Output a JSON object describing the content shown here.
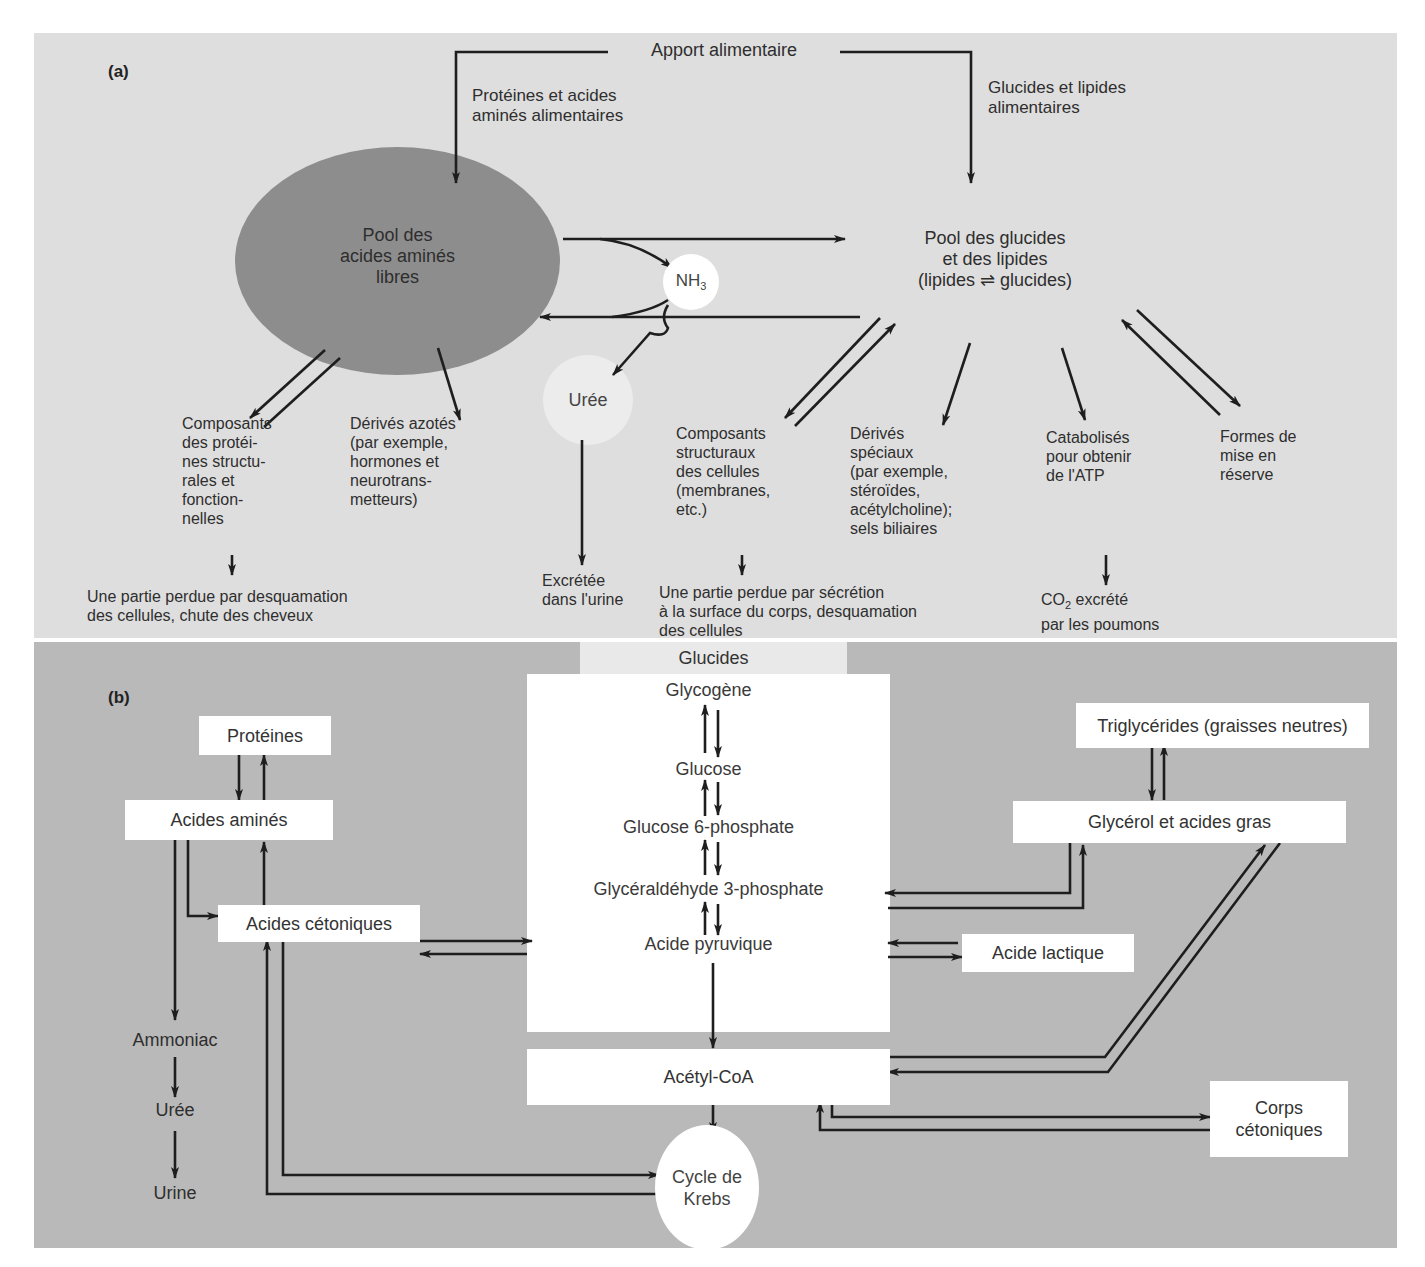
{
  "panel_a": {
    "tag": "(a)",
    "top_source": "Apport alimentaire",
    "left_input": "Protéines et acides\naminés alimentaires",
    "right_input": "Glucides et lipides\nalimentaires",
    "pool_amino": "Pool des\nacides aminés\nlibres",
    "pool_carb_lipid": "Pool des glucides\net des lipides\n(lipides ⇌ glucides)",
    "nh3": {
      "base": "NH",
      "sub": "3"
    },
    "urea": "Urée",
    "amino_outputs": [
      {
        "label": "Composants\ndes protéi-\nnes structu-\nrales et\nfonction-\nnelles"
      },
      {
        "label": "Dérivés azotés\n(par exemple,\nhormones et\nneurotrans-\nmetteurs)"
      }
    ],
    "urea_output": "Excrétée\ndans l'urine",
    "amino_loss": "Une partie perdue par desquamation\ndes cellules, chute des cheveux",
    "carb_outputs": [
      {
        "label": "Composants\nstructuraux\ndes cellules\n(membranes,\netc.)"
      },
      {
        "label": "Dérivés\nspéciaux\n(par exemple,\nstéroïdes,\nacétylcholine);\nsels biliaires"
      },
      {
        "label": "Catabolisés\npour obtenir\nde l'ATP"
      },
      {
        "label": "Formes de\nmise en\nréserve"
      }
    ],
    "carb_loss": "Une partie perdue par sécrétion\nà la surface du corps, desquamation\ndes cellules",
    "co2": {
      "base": "CO",
      "sub": "2",
      "rest": " excrété\npar les poumons"
    }
  },
  "panel_b": {
    "tag": "(b)",
    "glucides_header": "Glucides",
    "glucides_chain": [
      "Glycogène",
      "Glucose",
      "Glucose 6-phosphate",
      "Glycéraldéhyde 3-phosphate",
      "Acide pyruvique"
    ],
    "acetyl_coa": "Acétyl-CoA",
    "krebs": "Cycle de\nKrebs",
    "proteins": "Protéines",
    "amino_acids": "Acides aminés",
    "keto_acids": "Acides cétoniques",
    "nitrogen_chain": [
      "Ammoniac",
      "Urée",
      "Urine"
    ],
    "triglycerides": "Triglycérides (graisses neutres)",
    "glycerol": "Glycérol et acides gras",
    "lactic_acid": "Acide lactique",
    "ketone_bodies": "Corps\ncétoniques"
  },
  "colors": {
    "panel_a_bg": "#dedede",
    "panel_b_bg": "#b9b9b9",
    "amino_pool": "#8d8d8d",
    "box_fill": "#ffffff",
    "arrow": "#1e1e1e"
  }
}
